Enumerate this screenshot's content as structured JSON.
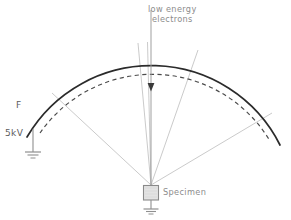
{
  "diagram": {
    "labels": {
      "beam_line1": "low energy",
      "beam_line2": "electrons",
      "grid_f": "F",
      "voltage": "5kV",
      "specimen": "Specimen"
    },
    "colors": {
      "background": "#ffffff",
      "arc_solid": "#2b2b2b",
      "arc_dashed": "#4a4a4a",
      "ray": "#b9b9b9",
      "beam": "#9a9a9a",
      "text": "#8c8c8c",
      "text_dark": "#5c5c5c",
      "specimen_fill": "#e0e0e0",
      "specimen_stroke": "#8a8a8a",
      "ground": "#8f8f8f"
    },
    "geometry": {
      "specimen_center_x": 151,
      "specimen_top_y": 185,
      "arc_center_x": 151,
      "arc_center_y": 186,
      "arc_solid_radius": 144,
      "arc_dashed_radius": 137,
      "beam_start_y": 10,
      "beam_arrow_y": 88,
      "ray_count": 5
    },
    "elements": [
      {
        "name": "solid-arc",
        "role": "grid-electrode-F",
        "style": "solid"
      },
      {
        "name": "dashed-arc",
        "role": "inner-grid",
        "style": "dashed"
      },
      {
        "name": "electron-beam",
        "role": "incident-beam",
        "style": "arrow-down"
      },
      {
        "name": "emission-rays",
        "role": "emitted-electron-trajectories",
        "count": 5
      },
      {
        "name": "specimen-box",
        "role": "sample-holder"
      },
      {
        "name": "ground-symbol-left",
        "role": "earth-ground-5kv"
      },
      {
        "name": "ground-symbol-specimen",
        "role": "earth-ground-specimen"
      }
    ]
  }
}
